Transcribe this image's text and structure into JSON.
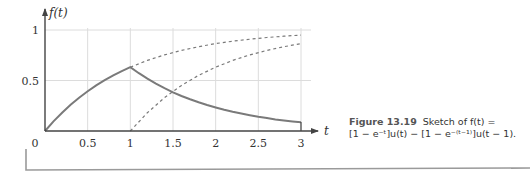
{
  "chart_data": {
    "type": "line",
    "title": "",
    "xlabel": "t",
    "ylabel": "f(t)",
    "xlim": [
      0,
      3
    ],
    "ylim": [
      0,
      1
    ],
    "grid": true,
    "x_ticks": [
      0,
      0.5,
      1,
      1.5,
      2,
      2.5,
      3
    ],
    "x_tick_labels": [
      "0",
      "0.5",
      "1",
      "1.5",
      "2",
      "2.5",
      "3"
    ],
    "y_ticks": [
      0.5,
      1
    ],
    "y_tick_labels": [
      "0.5",
      "1"
    ],
    "series": [
      {
        "name": "f(t) = (1 - e^-t)u(t) - (1 - e^-(t-1))u(t-1)",
        "style": "solid",
        "x": [
          0,
          0.1,
          0.2,
          0.3,
          0.4,
          0.5,
          0.6,
          0.7,
          0.8,
          0.9,
          1.0,
          1.1,
          1.2,
          1.3,
          1.4,
          1.5,
          1.6,
          1.7,
          1.8,
          1.9,
          2.0,
          2.1,
          2.2,
          2.3,
          2.4,
          2.5,
          2.6,
          2.7,
          2.8,
          2.9,
          3.0
        ],
        "values": [
          0,
          0.095,
          0.181,
          0.259,
          0.33,
          0.393,
          0.451,
          0.503,
          0.551,
          0.593,
          0.632,
          0.572,
          0.518,
          0.468,
          0.424,
          0.383,
          0.347,
          0.314,
          0.284,
          0.257,
          0.233,
          0.21,
          0.19,
          0.172,
          0.156,
          0.141,
          0.128,
          0.115,
          0.104,
          0.094,
          0.086
        ]
      },
      {
        "name": "(1 - e^-t)u(t) continuation",
        "style": "dashed",
        "x": [
          1.0,
          1.2,
          1.4,
          1.6,
          1.8,
          2.0,
          2.2,
          2.4,
          2.6,
          2.8,
          3.0
        ],
        "values": [
          0.632,
          0.699,
          0.753,
          0.798,
          0.835,
          0.865,
          0.889,
          0.909,
          0.926,
          0.939,
          0.95
        ]
      },
      {
        "name": "(1 - e^-(t-1))u(t-1)",
        "style": "dashed",
        "x": [
          1.0,
          1.2,
          1.4,
          1.6,
          1.8,
          2.0,
          2.2,
          2.4,
          2.6,
          2.8,
          3.0
        ],
        "values": [
          0,
          0.181,
          0.33,
          0.451,
          0.551,
          0.632,
          0.699,
          0.753,
          0.798,
          0.835,
          0.865
        ]
      }
    ],
    "colors": {
      "curve": "#7a7a7a",
      "axis": "#555555",
      "grid": "#dcdcdc",
      "frame": "#9a9a9a"
    }
  },
  "caption": {
    "figure_number": "Figure 13.19",
    "line1": "Sketch of f(t) =",
    "line2": "[1 − e⁻ᵗ]u(t) − [1 − e⁻⁽ᵗ⁻¹⁾]u(t − 1)."
  }
}
